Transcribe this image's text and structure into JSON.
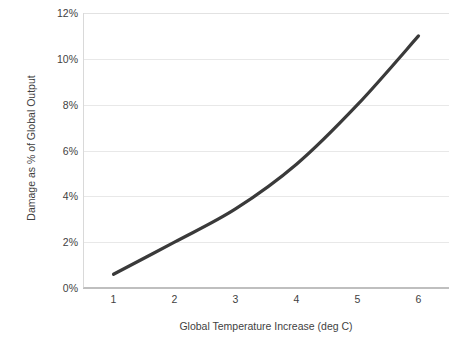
{
  "chart_data": {
    "type": "line",
    "title": "",
    "subtitle": "",
    "xlabel": "Global Temperature Increase (deg C)",
    "ylabel": "Damage as % of Global Output",
    "x": [
      1,
      2,
      3,
      4,
      5,
      6
    ],
    "values": [
      0.6,
      2.0,
      3.45,
      5.4,
      8.0,
      11.0
    ],
    "series": [
      {
        "name": "Damage as % of Global Output",
        "values": [
          0.6,
          2.0,
          3.45,
          5.4,
          8.0,
          11.0
        ]
      }
    ],
    "x_tick_labels": [
      "1",
      "2",
      "3",
      "4",
      "5",
      "6"
    ],
    "y_tick_labels": [
      "0%",
      "2%",
      "4%",
      "6%",
      "8%",
      "10%",
      "12%"
    ],
    "y_tick_values": [
      0,
      2,
      4,
      6,
      8,
      10,
      12
    ],
    "xlim": [
      0.5,
      6.5
    ],
    "ylim": [
      0,
      12
    ],
    "grid": "horizontal",
    "legend": "none",
    "line_color": "#3a3a3a",
    "line_width": 3.2,
    "grid_color": "#e8e8e8",
    "axis_color": "#bfbfbf",
    "text_color": "#3f3f3f",
    "background": "#ffffff",
    "annotations": []
  },
  "axes": {
    "y_title": "Damage as % of Global Output",
    "x_title": "Global Temperature Increase (deg C)"
  },
  "ticks": {
    "y": [
      {
        "label": "12%",
        "value": 12
      },
      {
        "label": "10%",
        "value": 10
      },
      {
        "label": "8%",
        "value": 8
      },
      {
        "label": "6%",
        "value": 6
      },
      {
        "label": "4%",
        "value": 4
      },
      {
        "label": "2%",
        "value": 2
      },
      {
        "label": "0%",
        "value": 0
      }
    ],
    "x": [
      {
        "label": "1",
        "value": 1
      },
      {
        "label": "2",
        "value": 2
      },
      {
        "label": "3",
        "value": 3
      },
      {
        "label": "4",
        "value": 4
      },
      {
        "label": "5",
        "value": 5
      },
      {
        "label": "6",
        "value": 6
      }
    ]
  },
  "title_sliver": ""
}
